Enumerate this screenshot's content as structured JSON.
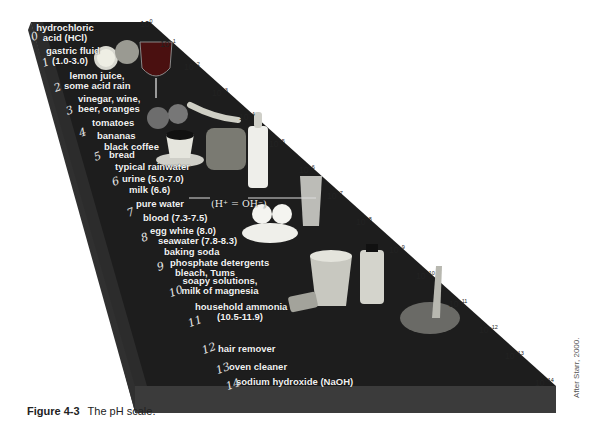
{
  "figure": {
    "caption_label": "Figure 4-3",
    "caption_text": "The pH scale.",
    "credit": "After Starr, 2000."
  },
  "ph_numbers": [
    "0",
    "1",
    "2",
    "3",
    "4",
    "5",
    "6",
    "7",
    "8",
    "9",
    "10",
    "11",
    "12",
    "13",
    "14"
  ],
  "substances": [
    {
      "text": "hydrochloric\nacid (HCl)",
      "line1": "hydrochloric",
      "line2": "acid (HCl)"
    },
    {
      "line1": "gastric fluid",
      "line2": "(1.0-3.0)"
    },
    {
      "line1": "lemon juice,",
      "line2": "some acid rain"
    },
    {
      "line1": "vinegar, wine,",
      "line2": "beer, oranges"
    },
    {
      "line1": "tomatoes"
    },
    {
      "line1": "bananas"
    },
    {
      "line1": "black coffee"
    },
    {
      "line1": "bread"
    },
    {
      "line1": "typical rainwater"
    },
    {
      "line1": "urine (5.0-7.0)"
    },
    {
      "line1": "milk (6.6)"
    },
    {
      "line1": "pure water"
    },
    {
      "line1": "blood (7.3-7.5)"
    },
    {
      "line1": "egg white (8.0)"
    },
    {
      "line1": "seawater (7.8-8.3)"
    },
    {
      "line1": "baking soda"
    },
    {
      "line1": "phosphate detergents"
    },
    {
      "line1": "bleach, Tums"
    },
    {
      "line1": "soapy solutions,",
      "line2": "milk of magnesia"
    },
    {
      "line1": "household ammonia",
      "line2": "(10.5-11.9)"
    },
    {
      "line1": "hair remover"
    },
    {
      "line1": "oven cleaner"
    },
    {
      "line1": "sodium hydroxide (NaOH)"
    }
  ],
  "neutral_annotation": "(H⁺ = OH⁻)",
  "exponents": {
    "base": "10",
    "powers": [
      "0",
      "−1",
      "−2",
      "−3",
      "−4",
      "−5",
      "−6",
      "−7",
      "−8",
      "−9",
      "−10",
      "−11",
      "−12",
      "−13",
      "−14"
    ]
  },
  "colors": {
    "slab_top": "#1c1c1c",
    "slab_front": "#3a3a3a",
    "slab_side": "#2b2b2b",
    "label": "#f2f2f2",
    "background": "#ffffff"
  }
}
